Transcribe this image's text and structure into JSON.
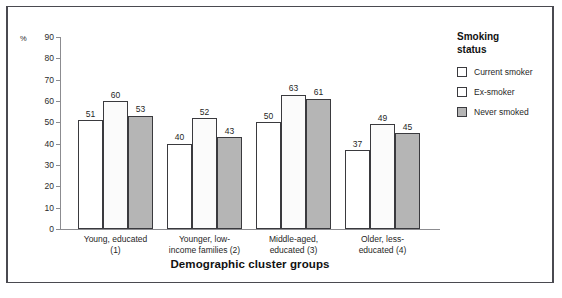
{
  "chart_data": {
    "type": "bar",
    "title": "",
    "xlabel": "Demographic cluster groups",
    "ylabel": "%",
    "ylim": [
      0,
      90
    ],
    "ytick_step": 10,
    "yticks": [
      90,
      80,
      70,
      60,
      50,
      40,
      30,
      20,
      10,
      0
    ],
    "grid": false,
    "legend_position": "right",
    "legend_title": "Smoking\nstatus",
    "categories": [
      "Young, educated (1)",
      "Younger, low-income families (2)",
      "Middle-aged, educated (3)",
      "Older, less-educated (4)"
    ],
    "category_lines": [
      [
        "Young, educated",
        "(1)"
      ],
      [
        "Younger, low-",
        "income families (2)"
      ],
      [
        "Middle-aged,",
        "educated (3)"
      ],
      [
        "Older, less-",
        "educated (4)"
      ]
    ],
    "series": [
      {
        "name": "Current smoker",
        "values": [
          51,
          40,
          50,
          37
        ],
        "color": "#ffffff"
      },
      {
        "name": "Ex-smoker",
        "values": [
          60,
          52,
          63,
          49
        ],
        "color": "#fbfbfb"
      },
      {
        "name": "Never smoked",
        "values": [
          53,
          43,
          61,
          45
        ],
        "color": "#b5b5b5"
      }
    ]
  },
  "legend": {
    "title_line1": "Smoking",
    "title_line2": "status",
    "items": [
      {
        "label": "Current smoker",
        "swatch": "series-current"
      },
      {
        "label": "Ex-smoker",
        "swatch": "series-ex"
      },
      {
        "label": "Never smoked",
        "swatch": "series-never"
      }
    ]
  },
  "axes": {
    "y_unit_symbol": "%",
    "x_title": "Demographic cluster groups"
  }
}
